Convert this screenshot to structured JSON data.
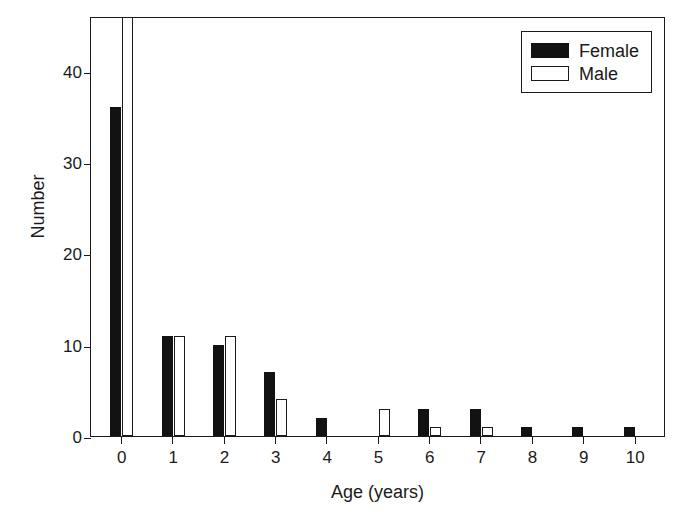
{
  "chart_data": {
    "type": "bar",
    "title": "",
    "xlabel": "Age (years)",
    "ylabel": "Number",
    "categories": [
      "0",
      "1",
      "2",
      "3",
      "4",
      "5",
      "6",
      "7",
      "8",
      "9",
      "10"
    ],
    "series": [
      {
        "name": "Female",
        "color": "#121212",
        "fill": "solid",
        "values": [
          36,
          11,
          10,
          7,
          2,
          0,
          3,
          3,
          1,
          1,
          1
        ]
      },
      {
        "name": "Male",
        "color": "#ffffff",
        "fill": "outline",
        "values": [
          null,
          11,
          11,
          4,
          0,
          3,
          1,
          1,
          0,
          0,
          0
        ]
      }
    ],
    "xlim": [
      -0.6,
      10.6
    ],
    "ylim": [
      0,
      46
    ],
    "ytick_values": [
      0,
      10,
      20,
      30,
      40
    ],
    "ytick_labels": [
      "0",
      "10",
      "20",
      "30",
      "40"
    ],
    "grid": false,
    "legend_position": "top-right"
  },
  "legend": {
    "entries": [
      {
        "label": "Female"
      },
      {
        "label": "Male"
      }
    ]
  }
}
